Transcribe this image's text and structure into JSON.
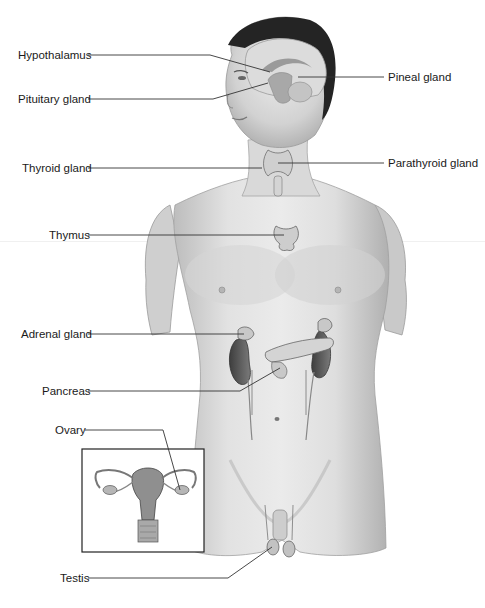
{
  "figure": {
    "colors": {
      "background": "#ffffff",
      "label_text": "#1a1a1a",
      "leader_line": "#333333",
      "skin_light": "#e4e4e4",
      "skin_mid": "#c8c8c8",
      "skin_shadow": "#a8a8a8",
      "hair": "#222222",
      "brain": "#d8d8d8",
      "organ_dark": "#555555",
      "inset_border": "#222222"
    }
  },
  "labels": {
    "hypothalamus": "Hypothalamus",
    "pituitary": "Pituitary gland",
    "pineal": "Pineal gland",
    "thyroid": "Thyroid gland",
    "parathyroid": "Parathyroid gland",
    "thymus": "Thymus",
    "adrenal": "Adrenal gland",
    "pancreas": "Pancreas",
    "ovary": "Ovary",
    "testis": "Testis"
  },
  "inset": {
    "subject": "female reproductive organs (uterus, fallopian tubes, ovaries)"
  }
}
